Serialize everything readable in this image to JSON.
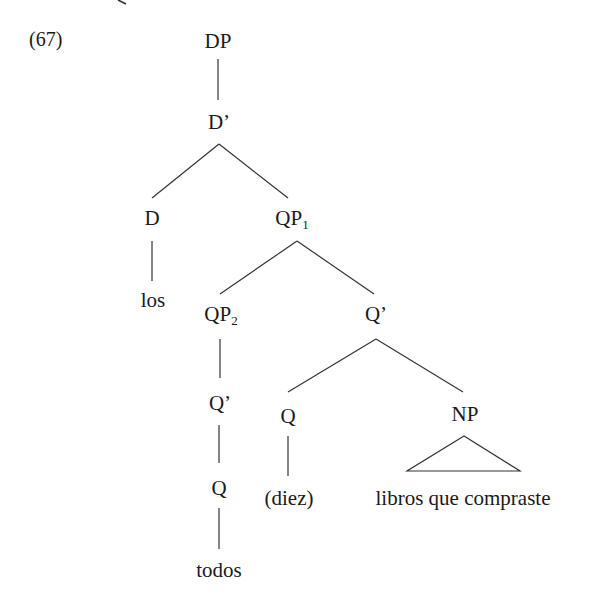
{
  "example": {
    "number": "(67)"
  },
  "tree": {
    "root": "DP",
    "nodes": {
      "dp": {
        "label": "DP",
        "subscript": ""
      },
      "d_bar": {
        "label": "D’",
        "subscript": ""
      },
      "d": {
        "label": "D",
        "subscript": ""
      },
      "los": {
        "label": "los",
        "subscript": ""
      },
      "qp1": {
        "label": "QP",
        "subscript": "1"
      },
      "qp2": {
        "label": "QP",
        "subscript": "2"
      },
      "q_bar_right": {
        "label": "Q’",
        "subscript": ""
      },
      "q_bar_left": {
        "label": "Q’",
        "subscript": ""
      },
      "q_left": {
        "label": "Q",
        "subscript": ""
      },
      "todos": {
        "label": "todos",
        "subscript": ""
      },
      "q_mid": {
        "label": "Q",
        "subscript": ""
      },
      "diez": {
        "label": "(diez)",
        "subscript": ""
      },
      "np": {
        "label": "NP",
        "subscript": ""
      },
      "np_content": {
        "label": "libros que compraste",
        "subscript": ""
      }
    },
    "structure": [
      {
        "parent": "DP",
        "children": [
          "D’"
        ]
      },
      {
        "parent": "D’",
        "children": [
          "D",
          "QP1"
        ]
      },
      {
        "parent": "D",
        "children": [
          "los"
        ]
      },
      {
        "parent": "QP1",
        "children": [
          "QP2",
          "Q’"
        ]
      },
      {
        "parent": "QP2",
        "children": [
          "Q’"
        ]
      },
      {
        "parent": "Q’ (under QP2)",
        "children": [
          "Q"
        ]
      },
      {
        "parent": "Q (under QP2)",
        "children": [
          "todos"
        ]
      },
      {
        "parent": "Q’ (under QP1)",
        "children": [
          "Q",
          "NP"
        ]
      },
      {
        "parent": "Q (under Q’)",
        "children": [
          "(diez)"
        ]
      },
      {
        "parent": "NP",
        "children": [
          "libros que compraste"
        ],
        "triangle": true
      }
    ]
  },
  "colors": {
    "text": "#1a1a1a",
    "lines": "#333333",
    "background": "#ffffff"
  }
}
